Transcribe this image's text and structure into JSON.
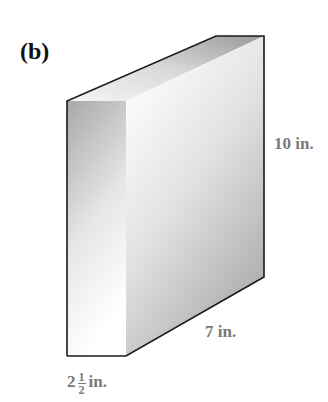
{
  "figure": {
    "panel_label": "(b)",
    "shape": "rectangular box (prism) drawn in 3D",
    "dimensions": {
      "height": "10 in.",
      "length": "7 in.",
      "width_whole": "2",
      "width_frac_num": "1",
      "width_frac_den": "2",
      "width_unit": "in."
    },
    "colors": {
      "edge": "#1a1a1a",
      "label": "#7a7a7a",
      "front_face_dark": "#a9a9a9",
      "front_face_light": "#ffffff",
      "side_face_light": "#f7f7f7",
      "side_face_dark": "#aaaaaa",
      "top_face_light": "#f2f2f2",
      "top_face_dark": "#9c9c9c"
    }
  }
}
